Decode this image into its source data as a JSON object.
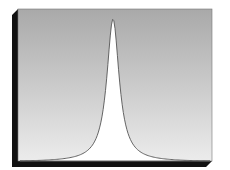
{
  "figure": {
    "colors": {
      "background": "#ffffff",
      "panel_gradient_top": "#a9a9a9",
      "panel_gradient_bottom": "#ececec",
      "shadow": "#111111",
      "curve_fill": "#ffffff",
      "curve_stroke": "#555555"
    },
    "panel": {
      "x": 18,
      "y": 9,
      "width": 194,
      "height": 152,
      "shadow_offset": 6
    },
    "peak": {
      "x": 113,
      "y": 19
    },
    "curve_shape": "lorentzian"
  },
  "chart_data": {
    "type": "line",
    "title": "",
    "xlabel": "",
    "ylabel": "",
    "x": [
      -1.0,
      -0.8,
      -0.6,
      -0.4,
      -0.3,
      -0.2,
      -0.15,
      -0.1,
      -0.05,
      0.0,
      0.05,
      0.1,
      0.15,
      0.2,
      0.3,
      0.4,
      0.6,
      0.8,
      1.0
    ],
    "values": [
      0.0,
      0.03,
      0.08,
      0.17,
      0.25,
      0.38,
      0.48,
      0.62,
      0.85,
      1.0,
      0.85,
      0.62,
      0.48,
      0.38,
      0.25,
      0.17,
      0.08,
      0.03,
      0.0
    ],
    "grid": false,
    "legend": false
  }
}
